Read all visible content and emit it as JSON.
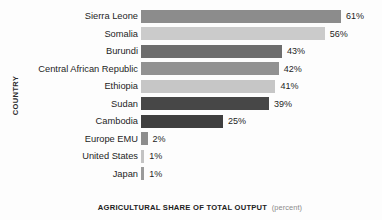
{
  "chart_data": {
    "type": "bar",
    "orientation": "horizontal",
    "title": "",
    "xlabel": "AGRICULTURAL SHARE OF TOTAL OUTPUT",
    "xlabel_unit": "(percent)",
    "ylabel": "COUNTRY",
    "xlim": [
      0,
      65
    ],
    "grid": false,
    "legend": null,
    "categories": [
      "Sierra Leone",
      "Somalia",
      "Burundi",
      "Central African Republic",
      "Ethiopia",
      "Sudan",
      "Cambodia",
      "Europe EMU",
      "United States",
      "Japan"
    ],
    "values": [
      61,
      56,
      43,
      42,
      41,
      39,
      25,
      2,
      1,
      1
    ],
    "value_labels": [
      "61%",
      "56%",
      "43%",
      "42%",
      "41%",
      "39%",
      "25%",
      "2%",
      "1%",
      "1%"
    ],
    "bar_colors": [
      "#8c8c8c",
      "#cbcbcb",
      "#6d6d6d",
      "#919191",
      "#c6c6c6",
      "#474747",
      "#3f3f3f",
      "#8d8d8d",
      "#c3c3c3",
      "#9a9a9a"
    ]
  },
  "axis": {
    "y_title": "COUNTRY",
    "x_title_main": "AGRICULTURAL SHARE OF TOTAL OUTPUT",
    "x_title_unit": "(percent)"
  }
}
